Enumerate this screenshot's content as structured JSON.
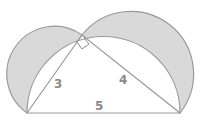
{
  "diagram": {
    "labels": {
      "leg_short": "3",
      "leg_long": "4",
      "hypotenuse": "5"
    },
    "colors": {
      "fill": "#d9d9d9",
      "stroke": "#9a9a9a",
      "label": "#8a8a8a"
    },
    "shapes": [
      "semicircle-on-leg-3 (shaded lune)",
      "semicircle-on-leg-4 (shaded lune)",
      "semicircle-on-hypotenuse",
      "right-triangle",
      "right-angle-marker"
    ]
  }
}
